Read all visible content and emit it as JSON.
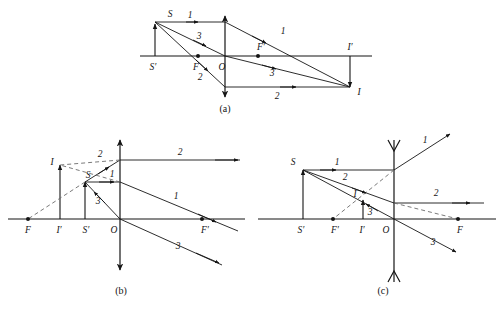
{
  "figure": {
    "background_color": "#ffffff",
    "stroke_color": "#151515",
    "dashed_color": "#6b6b6b",
    "panels": [
      {
        "id": "a",
        "caption": "(a)",
        "lens_type": "converging",
        "object_side": "left",
        "image_type": "real-inverted",
        "points": [
          {
            "name": "S",
            "label": "S"
          },
          {
            "name": "S-prime",
            "label": "S′"
          },
          {
            "name": "F",
            "label": "F"
          },
          {
            "name": "O",
            "label": "O"
          },
          {
            "name": "F-prime",
            "label": "F′"
          },
          {
            "name": "I-prime",
            "label": "I′"
          },
          {
            "name": "I",
            "label": "I"
          }
        ],
        "rays": [
          {
            "name": "ray-1-incident",
            "label": "1"
          },
          {
            "name": "ray-1-refracted",
            "label": "1"
          },
          {
            "name": "ray-3-incident",
            "label": "3"
          },
          {
            "name": "ray-3-refracted",
            "label": "3"
          },
          {
            "name": "ray-2-incident",
            "label": "2"
          },
          {
            "name": "ray-2-refracted",
            "label": "2"
          }
        ]
      },
      {
        "id": "b",
        "caption": "(b)",
        "lens_type": "converging",
        "object_side": "left",
        "image_type": "virtual-upright-magnified",
        "points": [
          {
            "name": "I",
            "label": "I"
          },
          {
            "name": "S",
            "label": "S"
          },
          {
            "name": "F",
            "label": "F"
          },
          {
            "name": "I-prime",
            "label": "I′"
          },
          {
            "name": "S-prime",
            "label": "S′"
          },
          {
            "name": "O",
            "label": "O"
          },
          {
            "name": "F-prime",
            "label": "F′"
          }
        ],
        "rays": [
          {
            "name": "ray-2-incident",
            "label": "2"
          },
          {
            "name": "ray-2-refracted",
            "label": "2"
          },
          {
            "name": "ray-1-incident",
            "label": "1"
          },
          {
            "name": "ray-1-refracted",
            "label": "1"
          },
          {
            "name": "ray-3-incident",
            "label": "3"
          },
          {
            "name": "ray-3-refracted",
            "label": "3"
          }
        ]
      },
      {
        "id": "c",
        "caption": "(c)",
        "lens_type": "diverging",
        "object_side": "left",
        "image_type": "virtual-upright-reduced",
        "points": [
          {
            "name": "S",
            "label": "S"
          },
          {
            "name": "S-prime",
            "label": "S′"
          },
          {
            "name": "F-prime",
            "label": "F′"
          },
          {
            "name": "I-prime",
            "label": "I′"
          },
          {
            "name": "I",
            "label": "I"
          },
          {
            "name": "O",
            "label": "O"
          },
          {
            "name": "F",
            "label": "F"
          }
        ],
        "rays": [
          {
            "name": "ray-1-incident",
            "label": "1"
          },
          {
            "name": "ray-1-refracted",
            "label": "1"
          },
          {
            "name": "ray-2-incident",
            "label": "2"
          },
          {
            "name": "ray-2-refracted",
            "label": "2"
          },
          {
            "name": "ray-3-incident",
            "label": "3"
          },
          {
            "name": "ray-3-refracted",
            "label": "3"
          }
        ]
      }
    ]
  },
  "panel_a": {
    "caption": "(a)",
    "S": "S",
    "S_prime": "S′",
    "F": "F",
    "O": "O",
    "F_prime": "F′",
    "I_prime": "I′",
    "I": "I",
    "ray1_in": "1",
    "ray1_out": "1",
    "ray3_in": "3",
    "ray3_out": "3",
    "ray2_in": "2",
    "ray2_out": "2"
  },
  "panel_b": {
    "caption": "(b)",
    "I": "I",
    "S": "S",
    "F": "F",
    "I_prime": "I′",
    "S_prime": "S′",
    "O": "O",
    "F_prime": "F′",
    "ray2_in": "2",
    "ray2_out": "2",
    "ray1_in": "1",
    "ray1_out": "1",
    "ray3_in": "3",
    "ray3_out": "3"
  },
  "panel_c": {
    "caption": "(c)",
    "S": "S",
    "S_prime": "S′",
    "F_prime": "F′",
    "I_prime": "I′",
    "I": "I",
    "O": "O",
    "F": "F",
    "ray1_in": "1",
    "ray1_out": "1",
    "ray2_in": "2",
    "ray2_out": "2",
    "ray3_in": "3",
    "ray3_out": "3"
  }
}
